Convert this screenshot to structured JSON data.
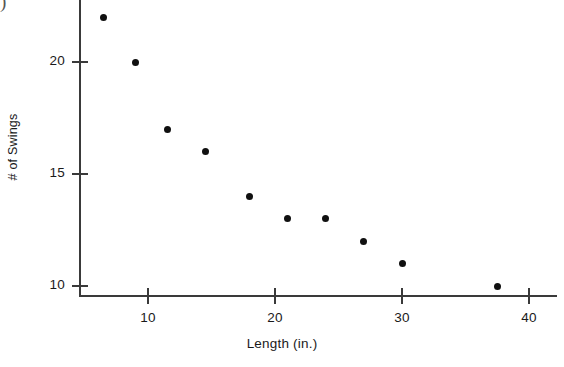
{
  "chart_data": {
    "type": "scatter",
    "title": "",
    "xlabel": "Length (in.)",
    "ylabel": "# of Swings",
    "xlim": [
      4.5,
      42
    ],
    "ylim": [
      9.2,
      22.8
    ],
    "grid": false,
    "legend": null,
    "xticks": [
      10,
      20,
      30,
      40
    ],
    "xtick_labels": [
      "10",
      "20",
      "30",
      "40"
    ],
    "yticks": [
      10,
      15,
      20
    ],
    "ytick_labels": [
      "10",
      "15",
      "20"
    ],
    "points": [
      {
        "x": 6.5,
        "y": 22
      },
      {
        "x": 9.0,
        "y": 20
      },
      {
        "x": 11.5,
        "y": 17
      },
      {
        "x": 14.5,
        "y": 16
      },
      {
        "x": 18.0,
        "y": 14
      },
      {
        "x": 21.0,
        "y": 13
      },
      {
        "x": 24.0,
        "y": 13
      },
      {
        "x": 27.0,
        "y": 12
      },
      {
        "x": 30.0,
        "y": 11
      },
      {
        "x": 37.5,
        "y": 10
      }
    ],
    "marker": {
      "shape": "circle",
      "color": "#101010",
      "size": 7
    },
    "axis_color": "#3a3a3a"
  },
  "artifacts": {
    "corner_glyph": ")"
  }
}
